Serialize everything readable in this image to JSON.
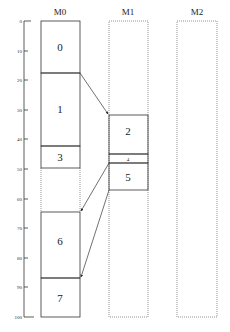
{
  "axis": {
    "min": 0,
    "max": 100,
    "ticks": [
      "0",
      "10",
      "20",
      "30",
      "40",
      "50",
      "60",
      "70",
      "80",
      "90",
      "100"
    ]
  },
  "columns": [
    {
      "title": "M0",
      "style": "solid-blocks-dotted-outline"
    },
    {
      "title": "M1",
      "style": "dotted-outline"
    },
    {
      "title": "M2",
      "style": "dotted-outline"
    }
  ],
  "blocks": [
    {
      "label": "0",
      "column": "M0",
      "start": 0,
      "end": 18
    },
    {
      "label": "1",
      "column": "M0",
      "start": 18,
      "end": 42
    },
    {
      "label": "3",
      "column": "M0",
      "start": 42,
      "end": 49
    },
    {
      "label": "6",
      "column": "M0",
      "start": 64,
      "end": 86
    },
    {
      "label": "7",
      "column": "M0",
      "start": 86,
      "end": 100
    },
    {
      "label": "2",
      "column": "M1",
      "start": 32,
      "end": 45
    },
    {
      "label": "4",
      "column": "M1",
      "start": 45,
      "end": 47.5
    },
    {
      "label": "5",
      "column": "M1",
      "start": 47.5,
      "end": 57
    }
  ],
  "arrows": [
    {
      "from": "M0 @18",
      "to": "M1 @32"
    },
    {
      "from": "M1 @47.5",
      "to": "M0 @64"
    },
    {
      "from": "M1 @57",
      "to": "M0 @86"
    }
  ],
  "colors": {
    "line": "#333333",
    "dotted": "#666666",
    "background": "#ffffff"
  }
}
